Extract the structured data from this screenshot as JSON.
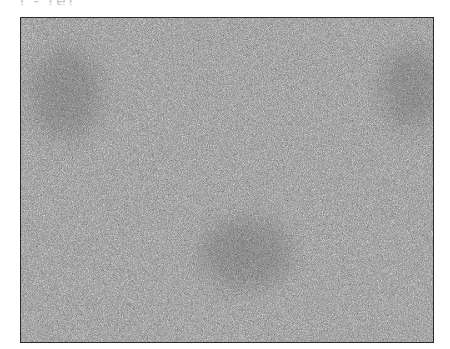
{
  "image": {
    "caption_partial": "? - ?e?",
    "description": "Grayscale noise image with faint darker regions",
    "colors": {
      "border": "#2a2a2a",
      "mid_gray": "#8a8a8a",
      "background": "#ffffff"
    }
  }
}
